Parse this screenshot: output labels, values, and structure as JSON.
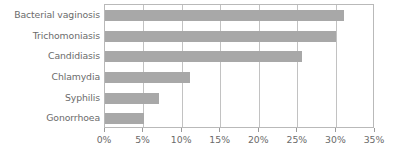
{
  "chart_data": {
    "type": "bar",
    "orientation": "horizontal",
    "title": "",
    "subtitle": "",
    "xlabel": "",
    "ylabel": "",
    "categories": [
      "Bacterial vaginosis",
      "Trichomoniasis",
      "Candidiasis",
      "Chlamydia",
      "Syphilis",
      "Gonorrhoea"
    ],
    "values": [
      31,
      30,
      25.5,
      11,
      7,
      5
    ],
    "value_unit": "%",
    "xlim": [
      0,
      35
    ],
    "xticks": [
      0,
      5,
      10,
      15,
      20,
      25,
      30,
      35
    ],
    "xtick_labels": [
      "0%",
      "5%",
      "10%",
      "15%",
      "20%",
      "25%",
      "30%",
      "35%"
    ],
    "grid": true,
    "grid_axis": "x",
    "legend": false,
    "legend_position": "none",
    "bar_color": "#a8a8a8",
    "grid_color": "#c2c2c2",
    "frame_color": "#b9b9b9",
    "text_color": "#6b6b6b",
    "background_color": "#ffffff"
  }
}
